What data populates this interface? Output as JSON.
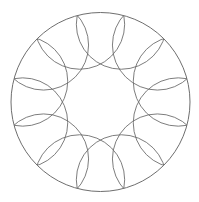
{
  "figure": {
    "title": "",
    "pattern": "rosette-of-12-circles",
    "stroke_color": "#6e6e6e",
    "background": "#ffffff",
    "outer_circle": {
      "cx": 100.5,
      "cy": 102,
      "r": 89.5
    },
    "ring": {
      "count": 12,
      "center_distance": 80.5,
      "circle_radius": 45,
      "start_angle_deg": 15
    }
  }
}
